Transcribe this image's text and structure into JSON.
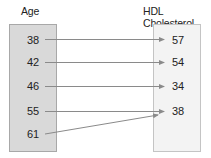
{
  "diagram": {
    "domain_label": "Age",
    "range_label": "HDL Cholesterol",
    "domain_values": [
      "38",
      "42",
      "46",
      "55",
      "61"
    ],
    "range_values": [
      "57",
      "54",
      "34",
      "38"
    ],
    "mappings": [
      {
        "from": "38",
        "to": "57"
      },
      {
        "from": "42",
        "to": "54"
      },
      {
        "from": "46",
        "to": "34"
      },
      {
        "from": "55",
        "to": "38"
      },
      {
        "from": "61",
        "to": "38"
      }
    ],
    "colors": {
      "domain_box": "#d9d9d9",
      "range_box": "#f3f3f3",
      "arrow": "#8a8a8a"
    }
  }
}
